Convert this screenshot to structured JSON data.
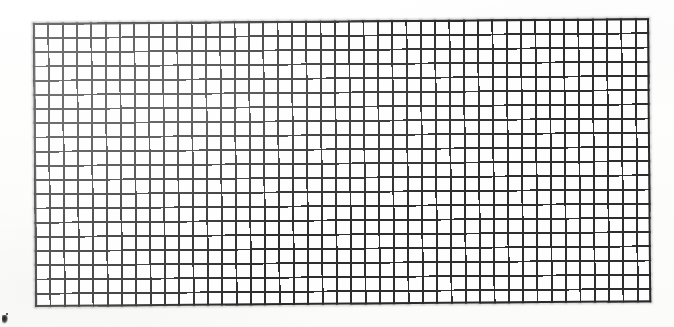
{
  "image": {
    "subject": "wire-mesh-grid",
    "description": "Scanned black-and-white image of a rectangular wire mesh / graph-paper grid on a white background",
    "caption": "",
    "background_color": "#fdfdfd",
    "line_color": "#2e2e2e",
    "cell_fill_color": "#fefefe"
  },
  "grid": {
    "columns": 43,
    "rows": 20,
    "cell_width_px": 14.3,
    "cell_height_px": 14.2,
    "line_width_px": 1.9,
    "rotation_deg": -0.45,
    "bounds": {
      "left_px": 33,
      "top_px": 23,
      "width_px": 616,
      "height_px": 284
    }
  },
  "artifacts": [
    {
      "name": "ink-smudge",
      "position": "bottom-left",
      "left_px": 2,
      "top_px": 315,
      "width_px": 7,
      "height_px": 9,
      "color": "#1b1b1b"
    }
  ],
  "labels": {
    "none": ""
  }
}
